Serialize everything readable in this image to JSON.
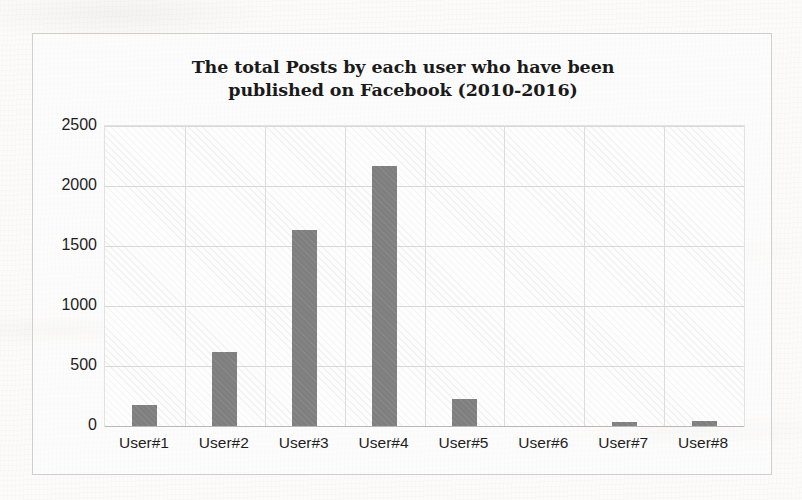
{
  "chart_data": {
    "type": "bar",
    "title": "The total Posts by each user who have been published on Facebook (2010-2016)",
    "title_line_1": "The total Posts by each user who have been",
    "title_line_2": "published on Facebook (2010-2016)",
    "xlabel": "",
    "ylabel": "",
    "categories": [
      "User#1",
      "User#2",
      "User#3",
      "User#4",
      "User#5",
      "User#6",
      "User#7",
      "User#8"
    ],
    "values": [
      175,
      615,
      1630,
      2170,
      225,
      0,
      30,
      40
    ],
    "ylim": [
      0,
      2500
    ],
    "yticks": [
      0,
      500,
      1000,
      1500,
      2000,
      2500
    ],
    "ytick_labels": [
      "0",
      "500",
      "1000",
      "1500",
      "2000",
      "2500"
    ],
    "grid": "horizontal-and-vertical",
    "legend": "none",
    "bar_color": "#7f7f7f",
    "plot_background": "#fdfdfd",
    "gridline_color": "#d8d8d8",
    "frame_color": "#cfcfcf",
    "text_color": "#1e1e1e"
  }
}
